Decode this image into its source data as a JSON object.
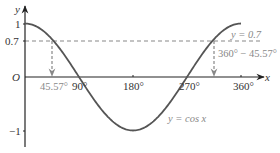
{
  "chart_data": {
    "type": "line",
    "title": "",
    "xlabel": "x",
    "ylabel": "y",
    "origin_label": "O",
    "xlim": [
      0,
      360
    ],
    "ylim": [
      -1,
      1
    ],
    "grid": false,
    "x_ticks": [
      {
        "value": 90,
        "label": "90°"
      },
      {
        "value": 180,
        "label": "180°"
      },
      {
        "value": 270,
        "label": "270°"
      },
      {
        "value": 360,
        "label": "360°"
      }
    ],
    "y_ticks": [
      {
        "value": 1,
        "label": "1"
      },
      {
        "value": 0.7,
        "label": "0.7"
      },
      {
        "value": -1,
        "label": "−1"
      }
    ],
    "series": [
      {
        "name": "y = cos x",
        "function": "cos",
        "x": [
          0,
          45,
          90,
          135,
          180,
          225,
          270,
          315,
          360
        ],
        "y": [
          1,
          0.707,
          0,
          -0.707,
          -1,
          -0.707,
          0,
          0.707,
          1
        ],
        "color": "#555555"
      }
    ],
    "reference_lines": [
      {
        "type": "horizontal",
        "y": 0.7,
        "label": "y = 0.7",
        "style": "dashed",
        "color": "#888888"
      }
    ],
    "annotations": [
      {
        "type": "arrow-down",
        "x": 45.57,
        "from_y": 0.7,
        "to_y": 0,
        "label": "45.57°"
      },
      {
        "type": "arrow-down",
        "x": 314.43,
        "from_y": 0.7,
        "to_y": 0,
        "label": "360° − 45.57°"
      }
    ],
    "curve_label": "y = cos x"
  },
  "labels": {
    "y_axis": "y",
    "x_axis": "x",
    "origin": "O",
    "y_one": "1",
    "y_point7": "0.7",
    "y_neg_one": "−1",
    "x_90": "90°",
    "x_180": "180°",
    "x_270": "270°",
    "x_360": "360°",
    "solution_1": "45.57°",
    "solution_2": "360° − 45.57°",
    "line_label": "y = 0.7",
    "curve_label": "y = cos x"
  },
  "colors": {
    "axis": "#222222",
    "curve": "#555555",
    "dashed": "#888888"
  }
}
